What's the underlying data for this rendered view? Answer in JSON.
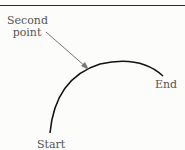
{
  "diagram": {
    "labels": {
      "second_point_line1": "Second",
      "second_point_line2": "point",
      "end": "End",
      "start": "Start"
    },
    "colors": {
      "arc": "#111111",
      "arrow": "#777777",
      "text": "#555555"
    }
  }
}
